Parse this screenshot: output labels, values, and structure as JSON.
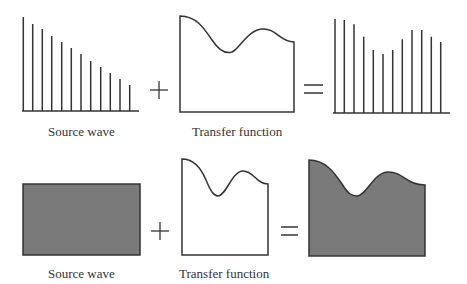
{
  "rows": [
    {
      "id": "discrete",
      "source": {
        "label": "Source wave",
        "type": "bars",
        "baseline_y": 111,
        "axis": [
          22,
          139
        ],
        "bars": [
          {
            "x": 23.3,
            "top": 17
          },
          {
            "x": 32.7,
            "top": 24
          },
          {
            "x": 42.3,
            "top": 29
          },
          {
            "x": 51.7,
            "top": 36
          },
          {
            "x": 61.7,
            "top": 42
          },
          {
            "x": 71.3,
            "top": 48
          },
          {
            "x": 81.0,
            "top": 54
          },
          {
            "x": 90.7,
            "top": 61
          },
          {
            "x": 100.7,
            "top": 67
          },
          {
            "x": 110.3,
            "top": 73
          },
          {
            "x": 120.0,
            "top": 79
          },
          {
            "x": 129.7,
            "top": 85
          }
        ]
      },
      "operator_plus": "+",
      "transfer": {
        "label": "Transfer function",
        "path": "M180,112 L180,16 C196,16 204,28 212,40 C220,52 226,54 232,52 C240,48 248,30 262,29 C276,28 280,42 294,42 L294,112 Z"
      },
      "operator_equals": "=",
      "result": {
        "type": "bars",
        "baseline_y": 113,
        "axis": [
          333,
          450
        ],
        "bars": [
          {
            "x": 335.0,
            "top": 19
          },
          {
            "x": 344.3,
            "top": 20
          },
          {
            "x": 354.0,
            "top": 24.3
          },
          {
            "x": 363.7,
            "top": 36.7
          },
          {
            "x": 373.3,
            "top": 50
          },
          {
            "x": 383.0,
            "top": 54
          },
          {
            "x": 392.7,
            "top": 50
          },
          {
            "x": 402.3,
            "top": 39.3
          },
          {
            "x": 412.0,
            "top": 30
          },
          {
            "x": 421.7,
            "top": 30
          },
          {
            "x": 431.3,
            "top": 36.7
          },
          {
            "x": 440.7,
            "top": 42
          }
        ]
      }
    },
    {
      "id": "continuous",
      "source": {
        "label": "Source wave",
        "type": "filled-rect",
        "rect": {
          "x": 23,
          "y": 184,
          "w": 117,
          "h": 71
        }
      },
      "operator_plus": "+",
      "transfer": {
        "label": "Transfer function",
        "path": "M182,255 L182,159 C194,159 201,168 206,180 C211,192 214,196 218,196 C226,196 232,171 243,171 C254,171 256,184 268,184 L268,255 Z"
      },
      "operator_equals": "=",
      "result": {
        "type": "filled-shape",
        "path": "M309,256 L309,160 C325,160 334,172 342,184 C348,194 352,196 357,196 C366,196 374,172 388,172 C404,172 406,185 425,185 L425,256 Z"
      }
    }
  ],
  "colors": {
    "line": "#333333",
    "fill": "#7a7a7a",
    "background": "#ffffff"
  }
}
